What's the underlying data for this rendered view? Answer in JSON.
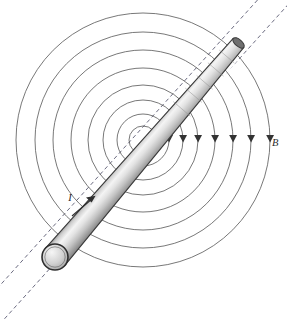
{
  "figure": {
    "background_color": "#ffffff",
    "width": 287,
    "height": 323
  },
  "labels": {
    "magnetic_field": "B",
    "current": "I"
  },
  "field": {
    "center": {
      "x": 143,
      "y": 140
    },
    "circle_color": "#555555",
    "circle_stroke_width": 0.8,
    "circle_count": 8,
    "circle_radii": [
      14,
      26,
      40,
      55,
      72,
      90,
      108,
      127
    ],
    "arrow_color": "#333333",
    "arrow_count": 8,
    "arrow_direction": "down",
    "arrow_label": "B"
  },
  "conductor": {
    "axis_angle_deg": -41,
    "start": {
      "x": 55,
      "y": 257
    },
    "end": {
      "x": 239,
      "y": 42
    },
    "start_radius": 13,
    "end_radius": 7,
    "body_color_light": "#f2f2f2",
    "body_color_mid": "#c9c9c9",
    "body_color_dark": "#8d8d8d",
    "outline_color": "#3a3a3a",
    "cap_fill": "#d6d6d6",
    "current_label": "I",
    "current_arrow_direction": "up-right"
  },
  "axis_line": {
    "style": "dashed",
    "color": "#5a5a72",
    "dash_pattern": "4 3",
    "stroke_width": 0.9,
    "offset_px": 13,
    "extends_beyond_rod": true
  }
}
